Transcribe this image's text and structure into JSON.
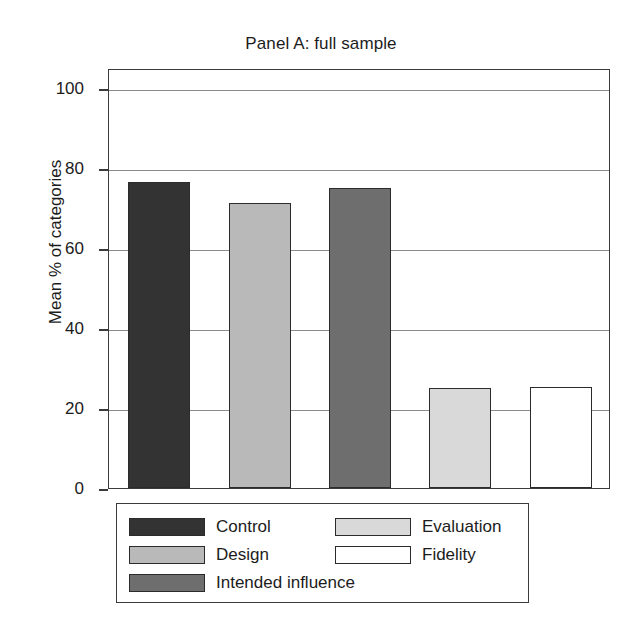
{
  "chart_data": {
    "type": "bar",
    "title": "Panel A: full sample",
    "xlabel": "",
    "ylabel": "Mean % of categories",
    "ylim": [
      0,
      105
    ],
    "yticks": [
      0,
      20,
      40,
      60,
      80,
      100
    ],
    "ytick_labels": [
      "0",
      "20",
      "40",
      "60",
      "80",
      "100"
    ],
    "grid": true,
    "legend_position": "below-plot",
    "categories": [
      "Control",
      "Design",
      "Intended influence",
      "Evaluation",
      "Fidelity"
    ],
    "values": [
      76.5,
      71.3,
      75.0,
      25.0,
      25.2
    ],
    "colors": [
      "#333333",
      "#b9b9b9",
      "#6e6e6e",
      "#d9d9d9",
      "#ffffff"
    ],
    "series": [
      {
        "name": "Mean % of categories",
        "values": [
          76.5,
          71.3,
          75.0,
          25.0,
          25.2
        ]
      }
    ]
  },
  "title": {
    "text": "Panel A: full sample"
  },
  "axes": {
    "y_label": "Mean % of categories",
    "y_ticks": [
      {
        "value": 100,
        "label": "100"
      },
      {
        "value": 80,
        "label": "80"
      },
      {
        "value": 60,
        "label": "60"
      },
      {
        "value": 40,
        "label": "40"
      },
      {
        "value": 20,
        "label": "20"
      },
      {
        "value": 0,
        "label": "0"
      }
    ]
  },
  "bars": [
    {
      "name": "control",
      "label": "Control",
      "value": 76.5,
      "color": "#333333"
    },
    {
      "name": "design",
      "label": "Design",
      "value": 71.3,
      "color": "#b9b9b9"
    },
    {
      "name": "intended-influence",
      "label": "Intended influence",
      "value": 75.0,
      "color": "#6e6e6e"
    },
    {
      "name": "evaluation",
      "label": "Evaluation",
      "value": 25.0,
      "color": "#d9d9d9"
    },
    {
      "name": "fidelity",
      "label": "Fidelity",
      "value": 25.2,
      "color": "#ffffff"
    }
  ],
  "legend": {
    "left_column": [
      {
        "label": "Control",
        "color": "#333333"
      },
      {
        "label": "Design",
        "color": "#b9b9b9"
      },
      {
        "label": "Intended influence",
        "color": "#6e6e6e"
      }
    ],
    "right_column": [
      {
        "label": "Evaluation",
        "color": "#d9d9d9"
      },
      {
        "label": "Fidelity",
        "color": "#ffffff"
      }
    ]
  }
}
